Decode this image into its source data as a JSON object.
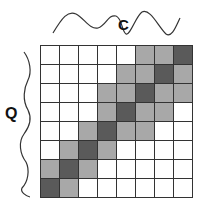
{
  "labels": {
    "top": "C",
    "left": "Q"
  },
  "colors": {
    "W": "#ffffff",
    "L": "#a8a8a8",
    "D": "#5a5a5a",
    "line": "#333333"
  },
  "matrix": [
    [
      "W",
      "W",
      "W",
      "W",
      "W",
      "L",
      "L",
      "D"
    ],
    [
      "W",
      "W",
      "W",
      "W",
      "L",
      "L",
      "D",
      "L"
    ],
    [
      "W",
      "W",
      "W",
      "L",
      "L",
      "D",
      "L",
      "L"
    ],
    [
      "W",
      "W",
      "W",
      "L",
      "D",
      "L",
      "L",
      "W"
    ],
    [
      "W",
      "W",
      "L",
      "D",
      "L",
      "L",
      "W",
      "W"
    ],
    [
      "W",
      "L",
      "D",
      "L",
      "W",
      "W",
      "W",
      "W"
    ],
    [
      "L",
      "D",
      "L",
      "W",
      "W",
      "W",
      "W",
      "W"
    ],
    [
      "D",
      "L",
      "W",
      "W",
      "W",
      "W",
      "W",
      "W"
    ]
  ]
}
